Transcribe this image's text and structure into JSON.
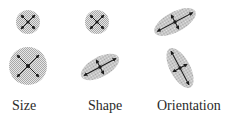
{
  "diagram": {
    "labels": {
      "size": "Size",
      "shape": "Shape",
      "orientation": "Orientation"
    },
    "colors": {
      "ellipse_fill": "#c8c8c8",
      "axis": "#1a1a1a",
      "background": "#ffffff"
    },
    "columns": [
      {
        "name": "Size",
        "ellipses": [
          {
            "cx": 28,
            "cy": 22,
            "rx": 12,
            "ry": 12,
            "angle": 0,
            "note": "small circle"
          },
          {
            "cx": 28,
            "cy": 66,
            "rx": 19,
            "ry": 19,
            "angle": 0,
            "note": "large circle"
          }
        ]
      },
      {
        "name": "Shape",
        "ellipses": [
          {
            "cx": 97,
            "cy": 22,
            "rx": 12,
            "ry": 12,
            "angle": 0,
            "note": "circle"
          },
          {
            "cx": 100,
            "cy": 67,
            "rx": 20,
            "ry": 10,
            "angle": -30,
            "note": "elongated ellipse"
          }
        ]
      },
      {
        "name": "Orientation",
        "ellipses": [
          {
            "cx": 175,
            "cy": 22,
            "rx": 22,
            "ry": 10,
            "angle": -30,
            "note": "ellipse tilted up-right"
          },
          {
            "cx": 180,
            "cy": 68,
            "rx": 22,
            "ry": 10,
            "angle": 60,
            "note": "ellipse tilted down-right"
          }
        ]
      }
    ]
  }
}
